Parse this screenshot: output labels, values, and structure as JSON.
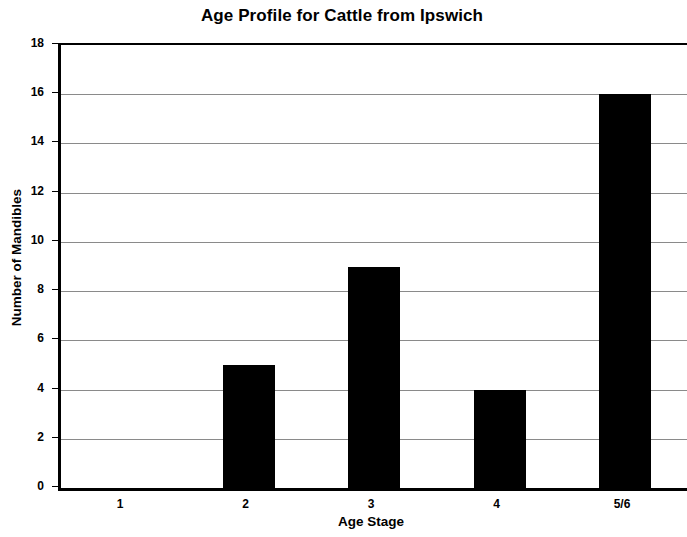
{
  "chart_data": {
    "type": "bar",
    "title": "Age Profile for Cattle from Ipswich",
    "xlabel": "Age Stage",
    "ylabel": "Number of Mandibles",
    "categories": [
      "1",
      "2",
      "3",
      "4",
      "5/6"
    ],
    "values": [
      0,
      5,
      9,
      4,
      16
    ],
    "series": [
      {
        "name": "Number of Mandibles",
        "values": [
          0,
          5,
          9,
          4,
          16
        ]
      }
    ],
    "ylim": [
      0,
      18
    ],
    "ytick_step": 2,
    "ytick_labels": [
      "0",
      "2",
      "4",
      "6",
      "8",
      "10",
      "12",
      "14",
      "16",
      "18"
    ],
    "grid": true,
    "grid_axis": "y",
    "legend": false,
    "legend_position": "none",
    "bar_color": "#000000",
    "gridline_color": "#8a8a8a",
    "axis_color": "#000000",
    "background_color": "#ffffff"
  }
}
